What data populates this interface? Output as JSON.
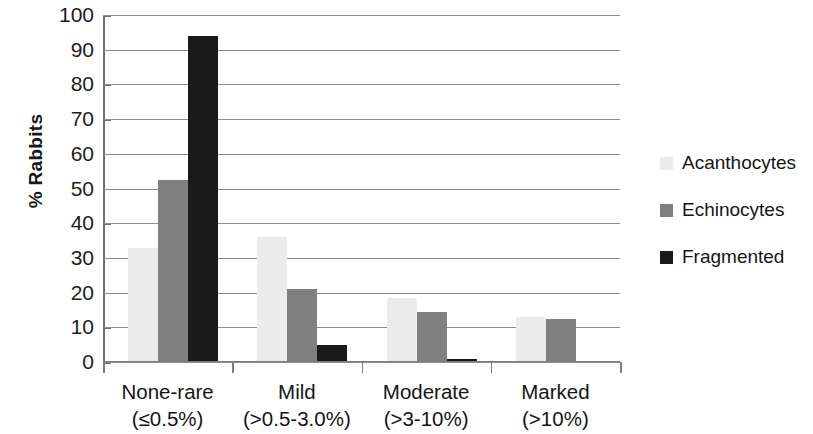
{
  "chart_data": {
    "type": "bar",
    "title": "",
    "xlabel": "",
    "ylabel": "% Rabbits",
    "ylim": [
      0,
      100
    ],
    "ytick_step": 10,
    "yticks": [
      0,
      10,
      20,
      30,
      40,
      50,
      60,
      70,
      80,
      90,
      100
    ],
    "grid": true,
    "legend_position": "right",
    "categories": [
      "None-rare (≤0.5%)",
      "Mild (>0.5-3.0%)",
      "Moderate (>3-10%)",
      "Marked (>10%)"
    ],
    "category_lines": [
      {
        "line1": "None-rare",
        "line2": "(≤0.5%)"
      },
      {
        "line1": "Mild",
        "line2": "(>0.5-3.0%)"
      },
      {
        "line1": "Moderate",
        "line2": "(>3-10%)"
      },
      {
        "line1": "Marked",
        "line2": "(>10%)"
      }
    ],
    "series": [
      {
        "name": "Acanthocytes",
        "color": "#ebebeb",
        "values": [
          33,
          36,
          18.5,
          13
        ]
      },
      {
        "name": "Echinocytes",
        "color": "#808080",
        "values": [
          52.5,
          21,
          14.5,
          12.5
        ]
      },
      {
        "name": "Fragmented",
        "color": "#1a1a1a",
        "values": [
          94,
          5,
          1,
          0
        ]
      }
    ]
  },
  "axis": {
    "y_title": "% Rabbits",
    "tick_labels": [
      "100",
      "90",
      "80",
      "70",
      "60",
      "50",
      "40",
      "30",
      "20",
      "10",
      "0"
    ]
  },
  "legend": {
    "items": [
      {
        "label": "Acanthocytes",
        "color": "#ebebeb"
      },
      {
        "label": "Echinocytes",
        "color": "#808080"
      },
      {
        "label": "Fragmented",
        "color": "#1a1a1a"
      }
    ]
  },
  "style": {
    "gridline_color": "#8d8d8d",
    "axis_color": "#6e6e6e",
    "text_color": "#171717",
    "background": "#ffffff"
  }
}
